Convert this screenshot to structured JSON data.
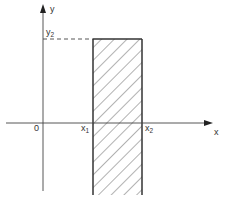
{
  "diagram": {
    "type": "region-plot",
    "axes": {
      "x_label": "x",
      "y_label": "y",
      "origin_label": "0"
    },
    "marks": {
      "x1": {
        "base": "x",
        "sub": "1"
      },
      "x2": {
        "base": "x",
        "sub": "2"
      },
      "y2": {
        "base": "y",
        "sub": "2"
      }
    },
    "region": {
      "fill": "hatched",
      "bounds": "x1 <= x <= x2, y <= y2"
    },
    "colors": {
      "stroke": "#333333",
      "background": "#ffffff"
    }
  }
}
